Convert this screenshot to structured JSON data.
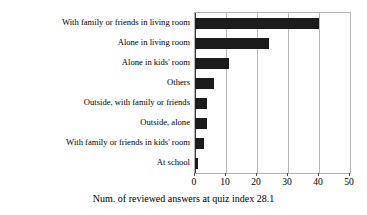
{
  "chart_data": {
    "type": "bar",
    "orientation": "horizontal",
    "title": "",
    "xlabel": "Num. of reviewed answers at quiz index 28.1",
    "ylabel": "",
    "categories": [
      "With family or friends in living room",
      "Alone in living room",
      "Alone in kids' room",
      "Others",
      "Outside, with family or friends",
      "Outside, alone",
      "With family or friends in kids' room",
      "At school"
    ],
    "values": [
      40,
      24,
      11,
      6,
      4,
      4,
      3,
      1
    ],
    "xlim": [
      0,
      50
    ],
    "xticks": [
      0,
      10,
      20,
      30,
      40,
      50
    ],
    "xtick_labels": [
      "0",
      "10",
      "20",
      "30",
      "40",
      "50"
    ],
    "grid": true,
    "grid_axis": "x",
    "legend": false,
    "bar_color": "#1c1c1c",
    "grid_color": "#b8b8b8",
    "axis_color": "#b4b4b4",
    "background": "#ffffff"
  },
  "caption": {
    "text": "Num. of reviewed answers at quiz index 28.1"
  }
}
